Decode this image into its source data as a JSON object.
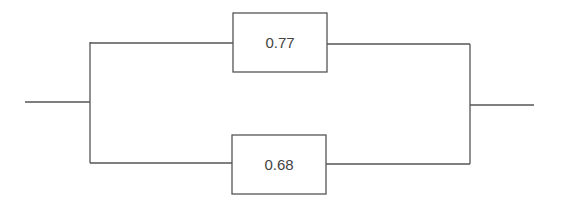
{
  "diagram": {
    "type": "parallel reliability block diagram",
    "colors": {
      "line": "#555555",
      "text": "#444444",
      "background": "#ffffff"
    },
    "blocks": [
      {
        "id": "top",
        "label": "0.77"
      },
      {
        "id": "bottom",
        "label": "0.68"
      }
    ]
  }
}
